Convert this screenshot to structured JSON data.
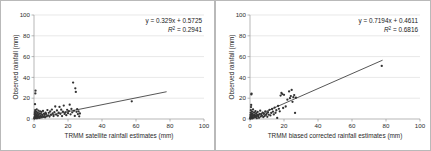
{
  "figure": {
    "panels": [
      {
        "name": "left",
        "equation": "y = 0.329x + 0.5725",
        "r2_prefix": "R",
        "r2_sup": "2",
        "r2_value": " = 0.2941"
      },
      {
        "name": "right",
        "equation": "y = 0.7194x + 0.4611",
        "r2_prefix": "R",
        "r2_sup": "2",
        "r2_value": " = 0.6816"
      }
    ]
  },
  "chart_data": [
    {
      "type": "scatter",
      "title": "",
      "xlabel": "TRMM satellite rainfall estimates (mm)",
      "ylabel": "Observed rainfall (mm)",
      "xlim": [
        0,
        100
      ],
      "ylim": [
        0,
        100
      ],
      "xticks": [
        0,
        20,
        40,
        60,
        80,
        100
      ],
      "yticks": [
        0,
        20,
        40,
        60,
        80,
        100
      ],
      "grid": "horizontal",
      "legend": "none",
      "annotations": [
        "y = 0.329x + 0.5725",
        "R² = 0.2941"
      ],
      "trendline": {
        "slope": 0.329,
        "intercept": 0.5725,
        "r2": 0.2941,
        "x_start": 0,
        "x_end": 78
      },
      "points": [
        [
          0.2,
          0.4
        ],
        [
          0.3,
          1.1
        ],
        [
          0.4,
          2.0
        ],
        [
          0.4,
          4.6
        ],
        [
          0.5,
          0.8
        ],
        [
          0.5,
          6.5
        ],
        [
          0.6,
          2.8
        ],
        [
          0.6,
          14.3
        ],
        [
          0.7,
          1.6
        ],
        [
          0.7,
          8.4
        ],
        [
          0.8,
          3.4
        ],
        [
          0.8,
          24.6
        ],
        [
          0.9,
          0.9
        ],
        [
          0.9,
          27.2
        ],
        [
          1.0,
          5.2
        ],
        [
          1.1,
          2.2
        ],
        [
          1.2,
          7.1
        ],
        [
          1.3,
          1.4
        ],
        [
          1.4,
          4.0
        ],
        [
          1.5,
          2.6
        ],
        [
          1.6,
          9.3
        ],
        [
          1.7,
          0.7
        ],
        [
          1.8,
          3.1
        ],
        [
          1.9,
          5.8
        ],
        [
          2.0,
          1.9
        ],
        [
          2.2,
          6.2
        ],
        [
          2.3,
          3.6
        ],
        [
          2.5,
          1.2
        ],
        [
          2.6,
          8.0
        ],
        [
          2.8,
          4.4
        ],
        [
          3.0,
          2.4
        ],
        [
          3.2,
          5.5
        ],
        [
          3.4,
          1.0
        ],
        [
          3.6,
          7.4
        ],
        [
          3.8,
          3.0
        ],
        [
          4.0,
          5.0
        ],
        [
          4.2,
          2.1
        ],
        [
          4.4,
          6.8
        ],
        [
          4.6,
          1.5
        ],
        [
          4.8,
          4.2
        ],
        [
          5.0,
          3.3
        ],
        [
          5.3,
          7.8
        ],
        [
          5.6,
          2.0
        ],
        [
          5.9,
          5.1
        ],
        [
          6.2,
          3.9
        ],
        [
          6.5,
          1.7
        ],
        [
          6.8,
          6.0
        ],
        [
          7.1,
          4.8
        ],
        [
          7.5,
          2.5
        ],
        [
          7.9,
          8.6
        ],
        [
          8.3,
          3.5
        ],
        [
          8.7,
          5.9
        ],
        [
          9.1,
          2.3
        ],
        [
          9.5,
          7.2
        ],
        [
          10.0,
          4.1
        ],
        [
          10.5,
          9.1
        ],
        [
          11.0,
          5.4
        ],
        [
          11.5,
          2.9
        ],
        [
          12.0,
          6.6
        ],
        [
          12.5,
          12.0
        ],
        [
          13.0,
          4.3
        ],
        [
          13.5,
          8.2
        ],
        [
          14.0,
          3.2
        ],
        [
          14.5,
          6.1
        ],
        [
          15.0,
          11.6
        ],
        [
          15.5,
          5.0
        ],
        [
          16.0,
          9.0
        ],
        [
          16.5,
          2.8
        ],
        [
          17.0,
          7.0
        ],
        [
          17.5,
          12.9
        ],
        [
          18.0,
          4.9
        ],
        [
          18.5,
          6.3
        ],
        [
          19.0,
          3.7
        ],
        [
          19.5,
          8.8
        ],
        [
          20.0,
          5.6
        ],
        [
          20.5,
          7.6
        ],
        [
          21.0,
          13.8
        ],
        [
          21.5,
          4.5
        ],
        [
          22.0,
          9.7
        ],
        [
          22.5,
          6.4
        ],
        [
          23.0,
          35.0
        ],
        [
          23.5,
          7.9
        ],
        [
          24.0,
          3.0
        ],
        [
          24.3,
          29.5
        ],
        [
          24.6,
          26.0
        ],
        [
          25.0,
          6.9
        ],
        [
          25.4,
          9.4
        ],
        [
          25.8,
          4.7
        ],
        [
          26.2,
          7.3
        ],
        [
          26.6,
          2.6
        ],
        [
          27.0,
          5.3
        ],
        [
          57.5,
          17.0
        ]
      ]
    },
    {
      "type": "scatter",
      "title": "",
      "xlabel": "TRMM biased corrected rainfall estimates (mm)",
      "ylabel": "Observed rainfall (mm)",
      "xlim": [
        0,
        100
      ],
      "ylim": [
        0,
        100
      ],
      "xticks": [
        0,
        20,
        40,
        60,
        80,
        100
      ],
      "yticks": [
        0,
        20,
        40,
        60,
        80,
        100
      ],
      "grid": "horizontal",
      "legend": "none",
      "annotations": [
        "y = 0.7194x + 0.4611",
        "R² = 0.6816"
      ],
      "trendline": {
        "slope": 0.7194,
        "intercept": 0.4611,
        "r2": 0.6816,
        "x_start": 0,
        "x_end": 78
      },
      "points": [
        [
          0.2,
          0.3
        ],
        [
          0.2,
          1.0
        ],
        [
          0.3,
          2.2
        ],
        [
          0.3,
          4.0
        ],
        [
          0.4,
          0.7
        ],
        [
          0.4,
          6.0
        ],
        [
          0.5,
          3.1
        ],
        [
          0.5,
          8.5
        ],
        [
          0.6,
          1.4
        ],
        [
          0.6,
          11.5
        ],
        [
          0.7,
          2.6
        ],
        [
          0.7,
          13.5
        ],
        [
          0.8,
          0.9
        ],
        [
          0.8,
          23.6
        ],
        [
          0.9,
          24.4
        ],
        [
          1.0,
          4.8
        ],
        [
          1.1,
          1.8
        ],
        [
          1.2,
          7.0
        ],
        [
          1.3,
          3.4
        ],
        [
          1.4,
          0.6
        ],
        [
          1.5,
          5.2
        ],
        [
          1.6,
          2.0
        ],
        [
          1.8,
          9.2
        ],
        [
          2.0,
          3.8
        ],
        [
          2.2,
          1.2
        ],
        [
          2.4,
          6.4
        ],
        [
          2.6,
          2.9
        ],
        [
          2.8,
          4.4
        ],
        [
          3.0,
          1.6
        ],
        [
          3.2,
          7.6
        ],
        [
          3.4,
          3.0
        ],
        [
          3.6,
          5.6
        ],
        [
          3.8,
          2.3
        ],
        [
          4.0,
          0.8
        ],
        [
          4.2,
          4.1
        ],
        [
          4.5,
          6.8
        ],
        [
          4.8,
          2.7
        ],
        [
          5.0,
          3.6
        ],
        [
          5.3,
          1.1
        ],
        [
          5.6,
          5.0
        ],
        [
          6.0,
          8.0
        ],
        [
          6.3,
          2.4
        ],
        [
          6.6,
          4.6
        ],
        [
          7.0,
          3.2
        ],
        [
          7.4,
          6.2
        ],
        [
          7.8,
          1.9
        ],
        [
          8.2,
          4.9
        ],
        [
          8.6,
          2.8
        ],
        [
          9.0,
          7.2
        ],
        [
          9.4,
          3.9
        ],
        [
          9.8,
          5.4
        ],
        [
          10.2,
          2.1
        ],
        [
          10.6,
          6.6
        ],
        [
          11.0,
          4.2
        ],
        [
          11.5,
          8.8
        ],
        [
          12.0,
          3.4
        ],
        [
          12.5,
          5.8
        ],
        [
          13.0,
          9.6
        ],
        [
          13.5,
          7.0
        ],
        [
          14.0,
          4.4
        ],
        [
          14.5,
          11.0
        ],
        [
          15.0,
          6.0
        ],
        [
          15.5,
          8.4
        ],
        [
          16.0,
          1.0
        ],
        [
          16.5,
          12.6
        ],
        [
          17.0,
          9.8
        ],
        [
          17.5,
          7.4
        ],
        [
          18.0,
          22.5
        ],
        [
          18.5,
          25.0
        ],
        [
          19.0,
          24.0
        ],
        [
          19.5,
          10.6
        ],
        [
          20.0,
          23.2
        ],
        [
          21.0,
          12.0
        ],
        [
          22.0,
          18.6
        ],
        [
          23.0,
          26.5
        ],
        [
          23.5,
          20.0
        ],
        [
          24.0,
          22.0
        ],
        [
          24.5,
          28.0
        ],
        [
          25.0,
          16.5
        ],
        [
          25.5,
          21.0
        ],
        [
          26.0,
          23.0
        ],
        [
          26.5,
          5.8
        ],
        [
          27.0,
          20.5
        ],
        [
          77.5,
          51.0
        ]
      ]
    }
  ]
}
